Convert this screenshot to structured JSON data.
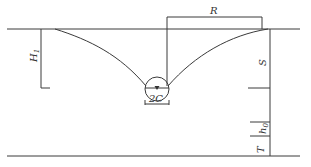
{
  "diagram": {
    "type": "well drawdown cross-section",
    "labels": {
      "radius": "R",
      "head": "H",
      "head_sub": "1",
      "drawdown": "S",
      "h": "h",
      "h_sub": "0",
      "thickness": "T",
      "diameter": "2C"
    },
    "colors": {
      "line": "#3a3a3a",
      "background": "#ffffff"
    }
  }
}
